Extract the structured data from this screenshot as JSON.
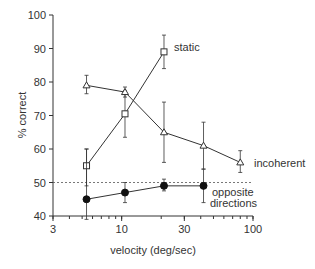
{
  "chart_data": {
    "type": "line",
    "title": "",
    "xlabel": "velocity (deg/sec)",
    "ylabel": "% correct",
    "xscale": "log",
    "xlim": [
      3,
      100
    ],
    "ylim": [
      40,
      100
    ],
    "xticks": [
      3,
      10,
      30,
      100
    ],
    "yticks": [
      40,
      50,
      60,
      70,
      80,
      90,
      100
    ],
    "grid": false,
    "legend": "inline labels",
    "reference_line": {
      "y": 50,
      "style": "dashed"
    },
    "series": [
      {
        "name": "static",
        "marker": "open-square",
        "x": [
          5.4,
          10.6,
          21
        ],
        "y": [
          55,
          70.5,
          89
        ],
        "err_low": [
          49,
          63.5,
          84
        ],
        "err_high": [
          60,
          77.5,
          94
        ]
      },
      {
        "name": "incoherent",
        "marker": "open-triangle",
        "x": [
          5.4,
          10.6,
          21,
          42,
          80
        ],
        "y": [
          79,
          77,
          65,
          61,
          56
        ],
        "err_low": [
          76.5,
          75.5,
          56,
          54,
          53
        ],
        "err_high": [
          82,
          78.5,
          74,
          68,
          59.5
        ]
      },
      {
        "name": "opposite directions",
        "marker": "filled-circle",
        "x": [
          5.4,
          10.6,
          21,
          42
        ],
        "y": [
          45,
          47,
          49,
          49
        ],
        "err_low": [
          39,
          44,
          47.5,
          44
        ],
        "err_high": [
          60,
          50,
          51,
          54
        ]
      }
    ]
  },
  "labels": {
    "ylabel": "% correct",
    "xlabel": "velocity (deg/sec)",
    "static": "static",
    "incoherent": "incoherent",
    "opposite_1": "opposite",
    "opposite_2": "directions"
  }
}
